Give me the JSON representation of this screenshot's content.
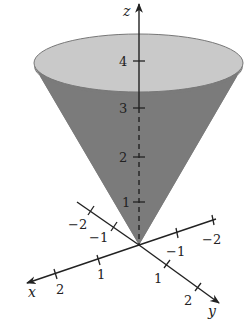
{
  "figure": {
    "title": "",
    "colors": {
      "background": "#ffffff",
      "cone_body": "#7b7b7b",
      "cone_top": "#c9c9c9",
      "rim": "#777777",
      "axis": "#222222"
    }
  },
  "axes": {
    "z": {
      "name": "z",
      "ticks": [
        {
          "label": "1",
          "value": 1
        },
        {
          "label": "2",
          "value": 2
        },
        {
          "label": "3",
          "value": 3
        },
        {
          "label": "4",
          "value": 4
        }
      ]
    },
    "x": {
      "name": "x",
      "ticks": [
        {
          "label": "−2",
          "value": -2
        },
        {
          "label": "−1",
          "value": -1
        },
        {
          "label": "1",
          "value": 1
        },
        {
          "label": "2",
          "value": 2
        }
      ]
    },
    "y": {
      "name": "y",
      "ticks": [
        {
          "label": "−2",
          "value": -2
        },
        {
          "label": "−1",
          "value": -1
        },
        {
          "label": "1",
          "value": 1
        },
        {
          "label": "2",
          "value": 2
        }
      ]
    }
  }
}
